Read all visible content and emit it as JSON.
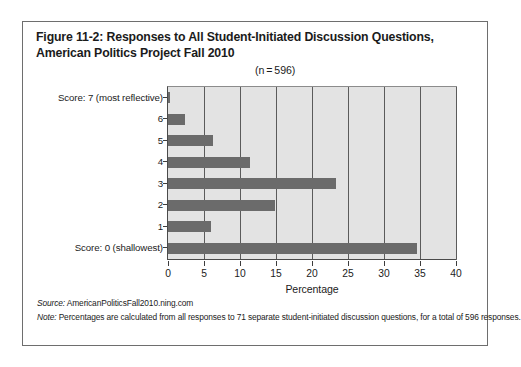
{
  "figure": {
    "title_line1": "Figure 11-2: Responses to All Student-Initiated Discussion Questions,",
    "title_line2": "American Politics Project Fall 2010",
    "n_label": "(n = 596)"
  },
  "footnotes": {
    "source_lead": "Source:",
    "source_text": " AmericanPoliticsFall2010.ning.com",
    "note_lead": "Note:",
    "note_text": " Percentages are calculated from all responses to 71 separate student-initiated discussion questions, for a total of 596 responses."
  },
  "chart_data": {
    "type": "bar",
    "orientation": "horizontal",
    "title": "Figure 11-2: Responses to All Student-Initiated Discussion Questions, American Politics Project Fall 2010",
    "xlabel": "Percentage",
    "ylabel": "",
    "xlim": [
      0,
      40
    ],
    "xticks": [
      0,
      5,
      10,
      15,
      20,
      25,
      30,
      35,
      40
    ],
    "xticklabels": [
      "0",
      "5",
      "10",
      "15",
      "20",
      "25",
      "30",
      "35",
      "40"
    ],
    "grid": "vertical",
    "legend": "none",
    "categories": [
      "Score: 7 (most reflective)",
      "6",
      "5",
      "4",
      "3",
      "2",
      "1",
      "Score: 0 (shallowest)"
    ],
    "values": [
      0.3,
      2.3,
      6.2,
      11.4,
      23.3,
      14.8,
      6.0,
      34.6
    ],
    "annotation": "(n = 596)",
    "bar_color": "#6b6b6b",
    "plot_background": "#e3e3e3"
  }
}
